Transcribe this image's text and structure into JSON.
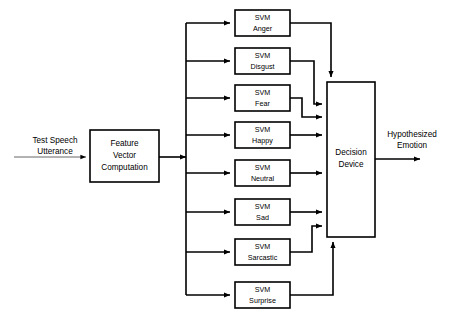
{
  "diagram": {
    "colors": {
      "stroke": "#000000",
      "fill": "#ffffff",
      "thin_stroke": "#555555"
    },
    "input": {
      "label_line1": "Test Speech",
      "label_line2": "Utterance"
    },
    "feature_block": {
      "line1": "Feature",
      "line2": "Vector",
      "line3": "Computation"
    },
    "svm_prefix": "SVM",
    "classifiers": [
      {
        "prefix": "SVM",
        "emotion": "Anger"
      },
      {
        "prefix": "SVM",
        "emotion": "Disgust"
      },
      {
        "prefix": "SVM",
        "emotion": "Fear"
      },
      {
        "prefix": "SVM",
        "emotion": "Happy"
      },
      {
        "prefix": "SVM",
        "emotion": "Neutral"
      },
      {
        "prefix": "SVM",
        "emotion": "Sad"
      },
      {
        "prefix": "SVM",
        "emotion": "Sarcastic"
      },
      {
        "prefix": "SVM",
        "emotion": "Surprise"
      }
    ],
    "decision_block": {
      "line1": "Decision",
      "line2": "Device"
    },
    "output": {
      "label_line1": "Hypothesized",
      "label_line2": "Emotion"
    }
  }
}
